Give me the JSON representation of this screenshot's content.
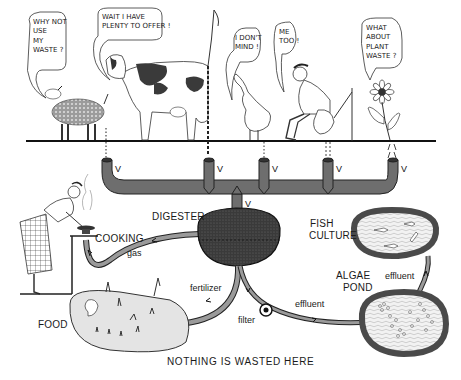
{
  "speech": {
    "sheep": "WHY NOT\nUSE\nMY\nWASTE ?",
    "cow": "WAIT I HAVE\nPLENTY TO OFFER !",
    "goose": "I DON'T\nMIND !",
    "man": "ME\nTOO !",
    "flower": "WHAT\nABOUT\nPLANT\nWASTE ?"
  },
  "labels": {
    "digester": "DIGESTER",
    "cooking": "COOKING",
    "gas": "gas",
    "fish_culture_1": "FISH",
    "fish_culture_2": "CULTURE",
    "algae_1": "ALGAE",
    "algae_2": "POND",
    "effluent_top": "effluent",
    "effluent_bottom": "effluent",
    "fertilizer": "fertilizer",
    "filter": "filter",
    "food": "FOOD",
    "caption": "NOTHING IS WASTED HERE"
  },
  "pipe_marks": {
    "v1": "V",
    "v2": "V",
    "v3": "V",
    "v4": "V",
    "v5": "V",
    "v6": "V"
  },
  "colors": {
    "ink": "#1a1a1a",
    "pipe_fill": "#6e6e6e",
    "pond_rim": "#4a4a4a",
    "pond_fill": "#eeeeee",
    "digester_fill": "#3a3a3a"
  }
}
